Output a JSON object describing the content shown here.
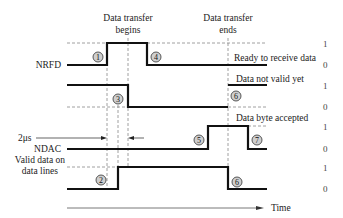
{
  "title_labels": {
    "transfer_begins_line1": "Data transfer",
    "transfer_begins_line2": "begins",
    "transfer_ends_line1": "Data transfer",
    "transfer_ends_line2": "ends"
  },
  "signals": [
    {
      "name": "NRFD",
      "annotation": "Ready to receive data"
    },
    {
      "name": "",
      "annotation": "Data not valid yet"
    },
    {
      "name": "NDAC",
      "annotation": "Data byte accepted"
    },
    {
      "name_line1": "Valid data on",
      "name_line2": "data lines",
      "annotation": ""
    }
  ],
  "levels": {
    "high": "1",
    "low": "0"
  },
  "timing_label": "2μs",
  "axis_label": "Time",
  "markers": [
    "1",
    "2",
    "3",
    "4",
    "5",
    "6",
    "6",
    "7"
  ]
}
